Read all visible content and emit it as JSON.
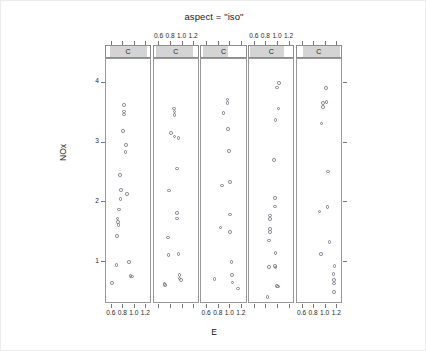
{
  "chart_data": {
    "type": "scatter",
    "title": "aspect = \"iso\"",
    "xlabel": "E",
    "ylabel": "NOx",
    "xlim": [
      0.5,
      1.3
    ],
    "ylim": [
      0.3,
      4.4
    ],
    "xticks": [
      0.6,
      0.8,
      1.0,
      1.2
    ],
    "xticklabels": [
      "0.6",
      "0.8",
      "1.0",
      "1.2"
    ],
    "yticks": [
      1,
      2,
      3,
      4
    ],
    "yticklabels": [
      "1",
      "2",
      "3",
      "4"
    ],
    "grid": false,
    "legend": null,
    "conditioning_variable": "C",
    "panel_strip_label": "C",
    "panel_count": 5,
    "bottom_axis_labeled_panels": [
      0,
      2,
      4
    ],
    "top_axis_labeled_panels": [
      1,
      3
    ],
    "panels": [
      {
        "index": 0,
        "strip_label": "C",
        "strip_fill_start": 0.1,
        "strip_fill_end": 0.92,
        "points": [
          {
            "x": 0.812,
            "y": 3.63
          },
          {
            "x": 0.81,
            "y": 3.52
          },
          {
            "x": 0.812,
            "y": 3.47
          },
          {
            "x": 0.79,
            "y": 3.2
          },
          {
            "x": 0.845,
            "y": 2.96
          },
          {
            "x": 0.838,
            "y": 2.84
          },
          {
            "x": 0.742,
            "y": 2.46
          },
          {
            "x": 0.76,
            "y": 2.21
          },
          {
            "x": 0.86,
            "y": 2.14
          },
          {
            "x": 0.748,
            "y": 2.06
          },
          {
            "x": 0.722,
            "y": 1.88
          },
          {
            "x": 0.7,
            "y": 1.73
          },
          {
            "x": 0.712,
            "y": 1.67
          },
          {
            "x": 0.718,
            "y": 1.62
          },
          {
            "x": 0.69,
            "y": 1.44
          },
          {
            "x": 0.68,
            "y": 0.95
          },
          {
            "x": 0.9,
            "y": 1.0
          },
          {
            "x": 0.925,
            "y": 0.77
          },
          {
            "x": 0.95,
            "y": 0.76
          },
          {
            "x": 0.6,
            "y": 0.65
          }
        ]
      },
      {
        "index": 1,
        "strip_label": "C",
        "strip_fill_start": 0.06,
        "strip_fill_end": 0.9,
        "points": [
          {
            "x": 0.855,
            "y": 3.57
          },
          {
            "x": 0.858,
            "y": 3.52
          },
          {
            "x": 0.862,
            "y": 3.46
          },
          {
            "x": 0.8,
            "y": 3.16
          },
          {
            "x": 0.862,
            "y": 3.1
          },
          {
            "x": 0.93,
            "y": 3.08
          },
          {
            "x": 0.9,
            "y": 2.57
          },
          {
            "x": 0.77,
            "y": 2.2
          },
          {
            "x": 0.9,
            "y": 1.82
          },
          {
            "x": 0.9,
            "y": 1.73
          },
          {
            "x": 0.745,
            "y": 1.41
          },
          {
            "x": 0.76,
            "y": 1.12
          },
          {
            "x": 0.93,
            "y": 1.14
          },
          {
            "x": 0.945,
            "y": 0.79
          },
          {
            "x": 0.95,
            "y": 0.73
          },
          {
            "x": 0.975,
            "y": 0.7
          },
          {
            "x": 0.69,
            "y": 0.63
          },
          {
            "x": 0.7,
            "y": 0.62
          }
        ]
      },
      {
        "index": 2,
        "strip_label": "C",
        "strip_fill_start": 0.03,
        "strip_fill_end": 0.6,
        "points": [
          {
            "x": 0.95,
            "y": 3.72
          },
          {
            "x": 0.955,
            "y": 3.66
          },
          {
            "x": 0.88,
            "y": 3.5
          },
          {
            "x": 0.965,
            "y": 3.23
          },
          {
            "x": 0.975,
            "y": 2.86
          },
          {
            "x": 0.86,
            "y": 2.28
          },
          {
            "x": 0.995,
            "y": 2.34
          },
          {
            "x": 1.0,
            "y": 1.8
          },
          {
            "x": 0.83,
            "y": 1.58
          },
          {
            "x": 1.0,
            "y": 1.5
          },
          {
            "x": 1.02,
            "y": 1.0
          },
          {
            "x": 1.03,
            "y": 0.79
          },
          {
            "x": 0.73,
            "y": 0.72
          },
          {
            "x": 1.04,
            "y": 0.66
          },
          {
            "x": 1.13,
            "y": 0.56
          }
        ]
      },
      {
        "index": 3,
        "strip_label": "C",
        "strip_fill_start": 0.03,
        "strip_fill_end": 0.8,
        "points": [
          {
            "x": 1.02,
            "y": 4.0
          },
          {
            "x": 0.985,
            "y": 3.92
          },
          {
            "x": 1.01,
            "y": 3.57
          },
          {
            "x": 0.96,
            "y": 3.38
          },
          {
            "x": 0.93,
            "y": 2.71
          },
          {
            "x": 0.95,
            "y": 2.07
          },
          {
            "x": 0.95,
            "y": 1.93
          },
          {
            "x": 0.86,
            "y": 1.78
          },
          {
            "x": 0.863,
            "y": 1.72
          },
          {
            "x": 0.862,
            "y": 1.56
          },
          {
            "x": 0.865,
            "y": 1.5
          },
          {
            "x": 0.845,
            "y": 1.36
          },
          {
            "x": 0.955,
            "y": 1.15
          },
          {
            "x": 0.845,
            "y": 0.92
          },
          {
            "x": 0.95,
            "y": 0.94
          },
          {
            "x": 0.958,
            "y": 0.91
          },
          {
            "x": 0.98,
            "y": 0.6
          },
          {
            "x": 1.0,
            "y": 0.59
          },
          {
            "x": 0.82,
            "y": 0.42
          }
        ]
      },
      {
        "index": 4,
        "strip_label": "C",
        "strip_fill_start": 0.13,
        "strip_fill_end": 0.97,
        "points": [
          {
            "x": 1.01,
            "y": 3.91
          },
          {
            "x": 0.95,
            "y": 3.66
          },
          {
            "x": 0.955,
            "y": 3.6
          },
          {
            "x": 1.015,
            "y": 3.68
          },
          {
            "x": 0.928,
            "y": 3.32
          },
          {
            "x": 1.04,
            "y": 2.52
          },
          {
            "x": 1.035,
            "y": 1.92
          },
          {
            "x": 0.895,
            "y": 1.85
          },
          {
            "x": 1.065,
            "y": 1.34
          },
          {
            "x": 0.918,
            "y": 1.14
          },
          {
            "x": 1.15,
            "y": 0.94
          },
          {
            "x": 1.135,
            "y": 0.8
          },
          {
            "x": 1.142,
            "y": 0.7
          },
          {
            "x": 1.14,
            "y": 0.64
          },
          {
            "x": 1.148,
            "y": 0.5
          }
        ]
      }
    ]
  },
  "axes": {
    "y_label": "NOx",
    "x_label": "E"
  }
}
